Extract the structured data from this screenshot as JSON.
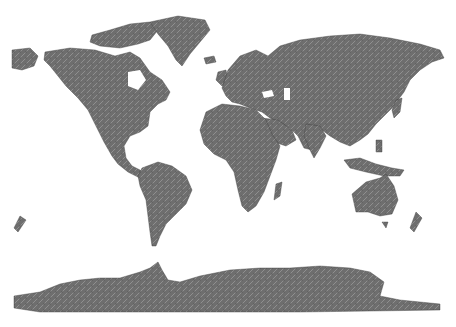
{
  "map": {
    "type": "shaded-relief world map",
    "projection": "equirectangular",
    "background_color": "#ffffff",
    "land_color": "#6e6e6e",
    "land_highlight": "#b5b5b5",
    "land_shadow": "#3a3a3a",
    "regions": [
      "North America",
      "Greenland",
      "South America",
      "Europe",
      "Africa",
      "Madagascar",
      "Asia",
      "Arabian Peninsula",
      "Indian Subcontinent",
      "Southeast Asia / Indonesia",
      "Japan",
      "Australia",
      "Tasmania",
      "New Zealand",
      "Antarctica",
      "British Isles",
      "Iceland",
      "Arctic Archipelago"
    ]
  }
}
